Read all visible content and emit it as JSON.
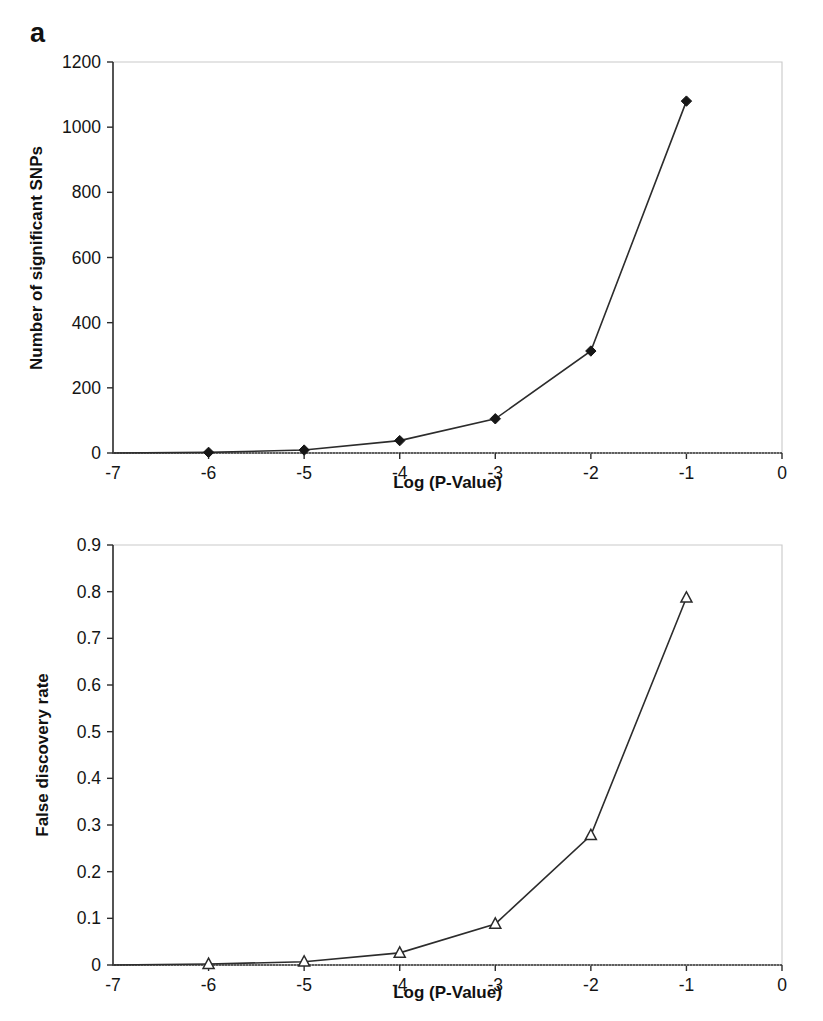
{
  "figure": {
    "background_color": "#ffffff",
    "line_color": "#2c2c2c",
    "frame_color": "#c9c9c9"
  },
  "panels": [
    {
      "label": "a",
      "axis_label_x": "Log (P-Value)",
      "axis_label_y": "Number of significant SNPs",
      "x_ticks": [
        "-7",
        "-6",
        "-5",
        "-4",
        "-3",
        "-2",
        "-1",
        "0"
      ],
      "y_ticks": [
        "0",
        "200",
        "400",
        "600",
        "800",
        "1000",
        "1200"
      ]
    },
    {
      "label": "b",
      "axis_label_x": "Log (P-Value)",
      "axis_label_y": "False discovery rate",
      "x_ticks": [
        "-7",
        "-6",
        "-5",
        "-4",
        "-3",
        "-2",
        "-1",
        "0"
      ],
      "y_ticks": [
        "0",
        "0.1",
        "0.2",
        "0.3",
        "0.4",
        "0.5",
        "0.6",
        "0.7",
        "0.8",
        "0.9"
      ]
    }
  ],
  "chart_data": [
    {
      "type": "line",
      "panel": "a",
      "title": "",
      "xlabel": "Log (P-Value)",
      "ylabel": "Number of significant SNPs",
      "x": [
        -6,
        -5,
        -4,
        -3,
        -2,
        -1
      ],
      "values": [
        2,
        9,
        38,
        105,
        313,
        1080
      ],
      "series": [
        {
          "name": "Number of significant SNPs",
          "marker": "filled-diamond",
          "values": [
            2,
            9,
            38,
            105,
            313,
            1080
          ]
        }
      ],
      "xlim": [
        -7,
        0
      ],
      "ylim": [
        0,
        1200
      ],
      "xticks": [
        -7,
        -6,
        -5,
        -4,
        -3,
        -2,
        -1,
        0
      ],
      "yticks": [
        0,
        200,
        400,
        600,
        800,
        1000,
        1200
      ],
      "grid": false,
      "legend": "none"
    },
    {
      "type": "line",
      "panel": "b",
      "title": "",
      "xlabel": "Log (P-Value)",
      "ylabel": "False discovery rate",
      "x": [
        -6,
        -5,
        -4,
        -3,
        -2,
        -1
      ],
      "values": [
        0.002,
        0.007,
        0.026,
        0.088,
        0.278,
        0.787
      ],
      "series": [
        {
          "name": "False discovery rate",
          "marker": "open-triangle",
          "values": [
            0.002,
            0.007,
            0.026,
            0.088,
            0.278,
            0.787
          ]
        }
      ],
      "xlim": [
        -7,
        0
      ],
      "ylim": [
        0,
        0.9
      ],
      "xticks": [
        -7,
        -6,
        -5,
        -4,
        -3,
        -2,
        -1,
        0
      ],
      "yticks": [
        0,
        0.1,
        0.2,
        0.3,
        0.4,
        0.5,
        0.6,
        0.7,
        0.8,
        0.9
      ],
      "grid": false,
      "legend": "none"
    }
  ]
}
